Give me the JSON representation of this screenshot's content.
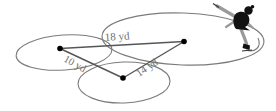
{
  "diagram": {
    "labels": {
      "side_top": "18 yd",
      "side_left": "10 yd",
      "side_right": "14 yd"
    },
    "colors": {
      "loop_stroke": "#7b7b7b",
      "triangle_stroke": "#565656",
      "label_text": "#6f6f6f",
      "dot_fill": "#000000",
      "skater_body": "#111111",
      "skater_limbs": "#9a9a9a",
      "background": "#ffffff"
    }
  }
}
